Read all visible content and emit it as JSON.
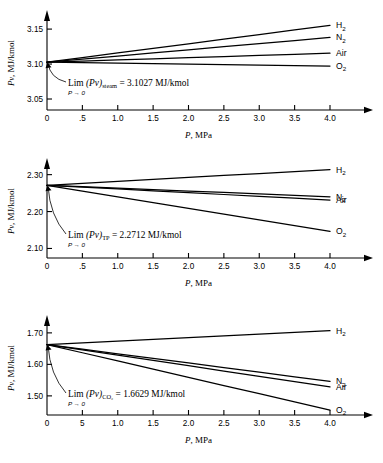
{
  "figure": {
    "title": "",
    "panel_count": 3
  },
  "chart_data": [
    {
      "type": "line",
      "title": "",
      "substance": "steam",
      "xlabel": "P, MPa",
      "ylabel": "Pv, MJ/kmol",
      "xlim": [
        0,
        4.35
      ],
      "ylim": [
        3.04,
        3.163
      ],
      "xticks": [
        0,
        0.5,
        1.0,
        1.5,
        2.0,
        2.5,
        3.0,
        3.5,
        4.0
      ],
      "xticklabels": [
        "0",
        ".5",
        "1.0",
        "1.5",
        "2.0",
        "2.5",
        "3.0",
        "3.5",
        "4.0"
      ],
      "yticks": [
        3.05,
        3.1,
        3.15
      ],
      "yticklabels": [
        "3.05",
        "3.10",
        "3.15"
      ],
      "grid": false,
      "legend_position": "right-inline",
      "limit_value": 3.1027,
      "annotation": {
        "lim_text": "Lim",
        "sub_text": "P → 0",
        "expr_text": "(Pv)",
        "subscript": "steam",
        "equals_text": "= 3.1027  MJ/kmol"
      },
      "x": [
        0,
        0.5,
        1.0,
        1.5,
        2.0,
        2.5,
        3.0,
        3.5,
        4.0
      ],
      "series": [
        {
          "name": "H₂",
          "label": "H",
          "sub": "2",
          "values": [
            3.1027,
            3.1093,
            3.1159,
            3.1225,
            3.129,
            3.1356,
            3.1422,
            3.1488,
            3.1554
          ]
        },
        {
          "name": "N₂",
          "label": "N",
          "sub": "2",
          "values": [
            3.1027,
            3.1071,
            3.1115,
            3.116,
            3.1204,
            3.1248,
            3.1292,
            3.1336,
            3.138
          ]
        },
        {
          "name": "Air",
          "label": "Air",
          "sub": "",
          "values": [
            3.1027,
            3.1043,
            3.1059,
            3.1075,
            3.1091,
            3.1107,
            3.1123,
            3.1139,
            3.1155
          ]
        },
        {
          "name": "O₂",
          "label": "O",
          "sub": "2",
          "values": [
            3.1027,
            3.102,
            3.1013,
            3.1006,
            3.0999,
            3.0992,
            3.0985,
            3.0978,
            3.0971
          ]
        }
      ]
    },
    {
      "type": "line",
      "title": "",
      "substance": "TP",
      "xlabel": "P, MPa",
      "ylabel": "Pv, MJ/kmol",
      "xlim": [
        0,
        4.35
      ],
      "ylim": [
        2.085,
        2.318
      ],
      "xticks": [
        0,
        0.5,
        1.0,
        1.5,
        2.0,
        2.5,
        3.0,
        3.5,
        4.0
      ],
      "xticklabels": [
        "0",
        ".5",
        "1.0",
        "1.5",
        "2.0",
        "2.5",
        "3.0",
        "3.5",
        "4.0"
      ],
      "yticks": [
        2.1,
        2.2,
        2.3
      ],
      "yticklabels": [
        "2.10",
        "2.20",
        "2.30"
      ],
      "grid": false,
      "legend_position": "right-inline",
      "limit_value": 2.2712,
      "annotation": {
        "lim_text": "Lim",
        "sub_text": "P → 0",
        "expr_text": "(Pv)",
        "subscript": "TP",
        "equals_text": "= 2.2712 MJ/kmol"
      },
      "x": [
        0,
        0.5,
        1.0,
        1.5,
        2.0,
        2.5,
        3.0,
        3.5,
        4.0
      ],
      "series": [
        {
          "name": "H₂",
          "label": "H",
          "sub": "2",
          "values": [
            2.2712,
            2.2765,
            2.2818,
            2.2871,
            2.2924,
            2.2977,
            2.303,
            2.3083,
            2.3136
          ]
        },
        {
          "name": "N₂",
          "label": "N",
          "sub": "2",
          "values": [
            2.2712,
            2.2673,
            2.2634,
            2.2595,
            2.2556,
            2.2517,
            2.2478,
            2.2439,
            2.24
          ]
        },
        {
          "name": "Air",
          "label": "Air",
          "sub": "",
          "values": [
            2.2712,
            2.2662,
            2.2612,
            2.2562,
            2.2512,
            2.2462,
            2.2412,
            2.2362,
            2.2312
          ]
        },
        {
          "name": "O₂",
          "label": "O",
          "sub": "2",
          "values": [
            2.2712,
            2.2556,
            2.24,
            2.2244,
            2.2088,
            2.1932,
            2.1776,
            2.162,
            2.1464
          ]
        }
      ]
    },
    {
      "type": "line",
      "title": "",
      "substance": "CO₂",
      "xlabel": "P, MPa",
      "ylabel": "Pv, MJ/kmol",
      "xlim": [
        0,
        4.35
      ],
      "ylim": [
        1.452,
        1.725
      ],
      "xticks": [
        0,
        0.5,
        1.0,
        1.5,
        2.0,
        2.5,
        3.0,
        3.5,
        4.0
      ],
      "xticklabels": [
        "0",
        "5",
        "1.0",
        "1.5",
        "2.0",
        "2.5",
        "3.0",
        "3.5",
        "4.0"
      ],
      "yticks": [
        1.5,
        1.6,
        1.7
      ],
      "yticklabels": [
        "1.50",
        "1.60",
        "1.70"
      ],
      "grid": false,
      "legend_position": "right-inline",
      "limit_value": 1.6629,
      "annotation": {
        "lim_text": "Lim",
        "sub_text": "P → 0",
        "expr_text": "(Pv)",
        "subscript": "CO₂",
        "equals_text": "= 1.6629 MJ/kmol"
      },
      "x": [
        0,
        0.5,
        1.0,
        1.5,
        2.0,
        2.5,
        3.0,
        3.5,
        4.0
      ],
      "series": [
        {
          "name": "H₂",
          "label": "H",
          "sub": "2",
          "values": [
            1.6629,
            1.6684,
            1.6739,
            1.6794,
            1.6849,
            1.6904,
            1.6959,
            1.7014,
            1.7069
          ]
        },
        {
          "name": "N₂",
          "label": "N",
          "sub": "2",
          "values": [
            1.6629,
            1.6483,
            1.6337,
            1.6191,
            1.6045,
            1.5899,
            1.5753,
            1.5607,
            1.5461
          ]
        },
        {
          "name": "Air",
          "label": "Air",
          "sub": "",
          "values": [
            1.6629,
            1.6461,
            1.6293,
            1.6125,
            1.5957,
            1.5789,
            1.5621,
            1.5453,
            1.5285
          ]
        },
        {
          "name": "O₂",
          "label": "O",
          "sub": "2",
          "values": [
            1.6629,
            1.6369,
            1.6109,
            1.5849,
            1.5589,
            1.5329,
            1.5069,
            1.4809,
            1.4549
          ]
        }
      ]
    }
  ]
}
